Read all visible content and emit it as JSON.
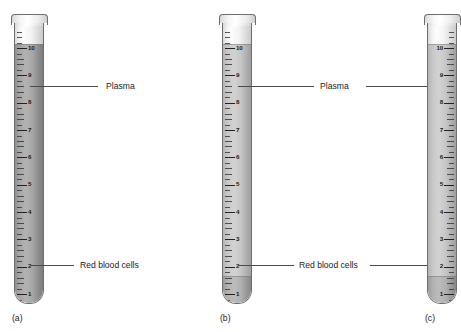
{
  "figure": {
    "title": "",
    "background_color": "#ffffff",
    "tube_outline_color": "#6e6e6e",
    "label_text_color": "#1b1b1b",
    "leader_line_color": "#4a4a4a"
  },
  "scale": {
    "unit_labels": [
      "10",
      "9",
      "8",
      "7",
      "6",
      "5",
      "4",
      "3",
      "2",
      "1"
    ],
    "max": 10,
    "min": 1
  },
  "tubes": [
    {
      "id": "a",
      "caption": "(a)",
      "scale_side": "left",
      "contents_description": "unseparated whole blood",
      "plasma_level": 10,
      "rbc_level": 10,
      "fill_top": 10
    },
    {
      "id": "b",
      "caption": "(b)",
      "scale_side": "left",
      "contents_description": "partially separated blood",
      "plasma_level": 10,
      "rbc_level": 1,
      "fill_top": 10
    },
    {
      "id": "c",
      "caption": "(c)",
      "scale_side": "right",
      "contents_description": "fully separated blood",
      "plasma_level": 10,
      "rbc_level": 1,
      "fill_top": 10
    }
  ],
  "annotations": {
    "plasma": {
      "label": "Plasma",
      "left_label_text": "Plasma",
      "right_label_text": "Plasma"
    },
    "red_blood_cells": {
      "label": "Red blood cells",
      "left_label_text": "Red blood cells",
      "right_label_text": "Red blood cells"
    }
  }
}
